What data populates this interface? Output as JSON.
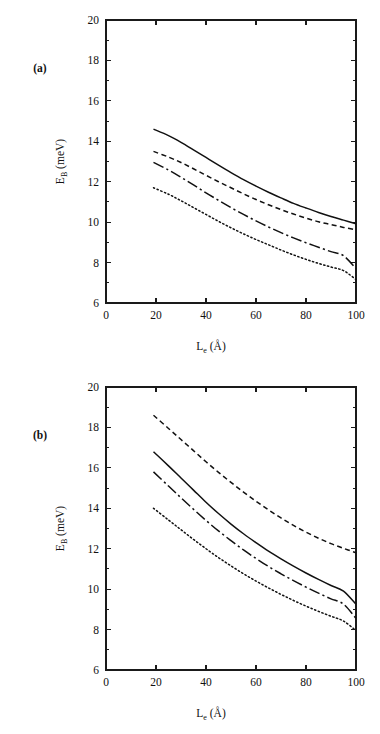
{
  "figure": {
    "background": "#ffffff",
    "ink_color": "#111111",
    "width": 380,
    "height": 734
  },
  "panels": [
    {
      "id": "a",
      "tag": "(a)",
      "tag_x": 40,
      "tag_y": 72
    },
    {
      "id": "b",
      "tag": "(b)",
      "tag_x": 40,
      "tag_y": 72
    }
  ],
  "axes": {
    "x_label_main": "L",
    "x_label_sub": "e",
    "x_label_unit": " (Å)",
    "y_label_main": "E",
    "y_label_sub": "B",
    "y_label_unit": " (meV)",
    "x_ticks": [
      0,
      20,
      40,
      60,
      80,
      100
    ],
    "x_tick_labels": [
      "0",
      "20",
      "40",
      "60",
      "80",
      "100"
    ],
    "y_ticks": [
      6,
      8,
      10,
      12,
      14,
      16,
      18,
      20
    ],
    "y_tick_labels": [
      "6",
      "8",
      "10",
      "12",
      "14",
      "16",
      "18",
      "20"
    ],
    "y_minor_ticks": [
      7,
      9,
      11,
      13,
      15,
      17,
      19
    ],
    "xlim": [
      0,
      100
    ],
    "ylim": [
      6,
      20
    ],
    "grid": false,
    "frame": "box",
    "tick_direction": "in"
  },
  "chart_data": [
    {
      "type": "line",
      "panel": "a",
      "title": "(a)",
      "xlabel": "L_e (Å)",
      "ylabel": "E_B (meV)",
      "xlim": [
        0,
        100
      ],
      "ylim": [
        6,
        20
      ],
      "grid": false,
      "legend": "none",
      "x": [
        19,
        25,
        30,
        35,
        40,
        45,
        50,
        55,
        60,
        65,
        70,
        75,
        80,
        85,
        90,
        95,
        100
      ],
      "series": [
        {
          "name": "curve-1",
          "style": "solid",
          "values": [
            14.6,
            14.28,
            13.95,
            13.58,
            13.2,
            12.82,
            12.45,
            12.1,
            11.78,
            11.48,
            11.2,
            10.93,
            10.7,
            10.48,
            10.28,
            10.1,
            9.92
          ]
        },
        {
          "name": "curve-2",
          "style": "dashed",
          "values": [
            13.5,
            13.22,
            12.95,
            12.64,
            12.32,
            12.0,
            11.7,
            11.4,
            11.12,
            10.86,
            10.62,
            10.4,
            10.2,
            10.02,
            9.88,
            9.74,
            9.62
          ]
        },
        {
          "name": "curve-3",
          "style": "dashdot",
          "values": [
            12.96,
            12.58,
            12.22,
            11.84,
            11.45,
            11.08,
            10.72,
            10.38,
            10.06,
            9.76,
            9.48,
            9.22,
            8.98,
            8.76,
            8.54,
            8.34,
            7.7
          ]
        },
        {
          "name": "curve-4",
          "style": "dotted",
          "values": [
            11.7,
            11.38,
            11.06,
            10.72,
            10.38,
            10.04,
            9.72,
            9.42,
            9.14,
            8.88,
            8.62,
            8.38,
            8.16,
            7.96,
            7.78,
            7.6,
            7.16
          ]
        }
      ]
    },
    {
      "type": "line",
      "panel": "b",
      "title": "(b)",
      "xlabel": "L_e (Å)",
      "ylabel": "E_B (meV)",
      "xlim": [
        0,
        100
      ],
      "ylim": [
        6,
        20
      ],
      "grid": false,
      "legend": "none",
      "x": [
        19,
        25,
        30,
        35,
        40,
        45,
        50,
        55,
        60,
        65,
        70,
        75,
        80,
        85,
        90,
        95,
        100
      ],
      "series": [
        {
          "name": "curve-1",
          "style": "dashed",
          "values": [
            18.6,
            17.95,
            17.4,
            16.85,
            16.3,
            15.78,
            15.28,
            14.8,
            14.35,
            13.92,
            13.52,
            13.15,
            12.82,
            12.52,
            12.25,
            12.02,
            11.8
          ]
        },
        {
          "name": "curve-2",
          "style": "solid",
          "values": [
            16.8,
            16.1,
            15.5,
            14.9,
            14.3,
            13.74,
            13.22,
            12.74,
            12.3,
            11.88,
            11.5,
            11.14,
            10.8,
            10.48,
            10.18,
            9.9,
            9.25
          ]
        },
        {
          "name": "curve-3",
          "style": "dashdot",
          "values": [
            15.8,
            15.1,
            14.52,
            13.95,
            13.4,
            12.88,
            12.4,
            11.94,
            11.52,
            11.12,
            10.76,
            10.42,
            10.1,
            9.8,
            9.52,
            9.26,
            8.55
          ]
        },
        {
          "name": "curve-4",
          "style": "dotted",
          "values": [
            14.0,
            13.42,
            12.94,
            12.46,
            12.0,
            11.56,
            11.15,
            10.76,
            10.4,
            10.06,
            9.74,
            9.44,
            9.16,
            8.9,
            8.66,
            8.42,
            7.95
          ]
        }
      ]
    }
  ]
}
